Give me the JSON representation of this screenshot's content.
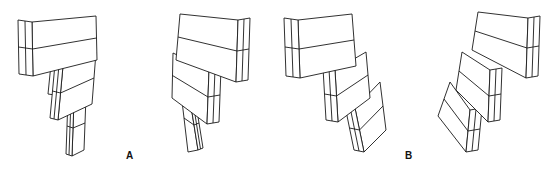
{
  "figure": {
    "panels": [
      {
        "id": "A",
        "label": "A",
        "views": [
          "left-view",
          "right-view"
        ],
        "block_count": 3
      },
      {
        "id": "B",
        "label": "B",
        "views": [
          "left-view",
          "right-view"
        ],
        "block_count": 3
      }
    ],
    "colors": {
      "line": "#1a1a1a",
      "background": "#ffffff"
    }
  }
}
